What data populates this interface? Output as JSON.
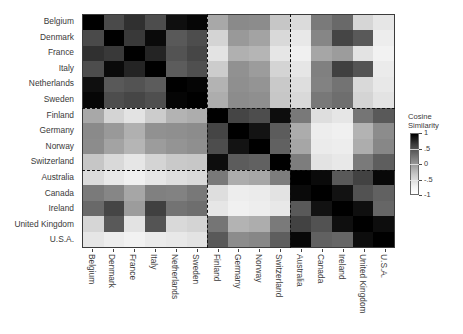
{
  "chart_data": {
    "type": "heatmap",
    "title": "",
    "xlabel": "",
    "ylabel": "",
    "grid": false,
    "legend_position": "right",
    "colormap": "grayscale-reversed",
    "colorbar": {
      "title_line1": "Cosine",
      "title_line2": "Similarity",
      "ticks": [
        "1",
        ".5",
        "0",
        "-.5",
        "-1"
      ],
      "vmin": -1,
      "vmax": 1,
      "dark_end_value": 1,
      "light_end_value": -1
    },
    "x_categories": [
      "Belgium",
      "Denmark",
      "France",
      "Italy",
      "Netherlands",
      "Sweden",
      "Finland",
      "Germany",
      "Norway",
      "Switzerland",
      "Australia",
      "Canada",
      "Ireland",
      "United Kingdom",
      "U.S.A."
    ],
    "y_categories": [
      "Belgium",
      "Denmark",
      "France",
      "Italy",
      "Netherlands",
      "Sweden",
      "Finland",
      "Germany",
      "Norway",
      "Switzerland",
      "Australia",
      "Canada",
      "Ireland",
      "United Kingdom",
      "U.S.A."
    ],
    "cluster_boundaries_after_index": [
      5,
      9
    ],
    "clusters": [
      {
        "name": "cluster-1",
        "members": [
          "Belgium",
          "Denmark",
          "France",
          "Italy",
          "Netherlands",
          "Sweden"
        ]
      },
      {
        "name": "cluster-2",
        "members": [
          "Finland",
          "Germany",
          "Norway",
          "Switzerland"
        ]
      },
      {
        "name": "cluster-3",
        "members": [
          "Australia",
          "Canada",
          "Ireland",
          "United Kingdom",
          "U.S.A."
        ]
      }
    ],
    "values": [
      [
        1.0,
        0.42,
        0.62,
        0.4,
        0.88,
        0.95,
        -0.32,
        -0.08,
        -0.1,
        -0.55,
        -0.72,
        0.04,
        0.18,
        -0.68,
        -0.8
      ],
      [
        0.42,
        1.0,
        0.55,
        0.92,
        0.3,
        0.4,
        -0.66,
        -0.2,
        -0.28,
        -0.7,
        -0.82,
        -0.05,
        0.46,
        0.3,
        -0.86
      ],
      [
        0.62,
        0.55,
        1.0,
        0.72,
        0.35,
        0.45,
        -0.78,
        -0.38,
        -0.42,
        -0.8,
        -0.88,
        -0.3,
        -0.22,
        -0.78,
        -0.9
      ],
      [
        0.4,
        0.92,
        0.72,
        1.0,
        0.28,
        0.38,
        -0.6,
        -0.14,
        -0.22,
        -0.66,
        -0.8,
        0.0,
        0.5,
        0.34,
        -0.84
      ],
      [
        0.88,
        0.3,
        0.35,
        0.28,
        1.0,
        0.96,
        -0.4,
        -0.12,
        -0.16,
        -0.58,
        -0.74,
        -0.02,
        0.1,
        -0.7,
        -0.82
      ],
      [
        0.95,
        0.4,
        0.45,
        0.38,
        0.96,
        1.0,
        -0.36,
        -0.1,
        -0.12,
        -0.56,
        -0.7,
        0.06,
        0.14,
        -0.66,
        -0.78
      ],
      [
        -0.32,
        -0.66,
        -0.78,
        -0.6,
        -0.4,
        -0.36,
        1.0,
        0.46,
        0.4,
        0.9,
        0.05,
        -0.74,
        -0.8,
        0.08,
        0.3
      ],
      [
        -0.08,
        -0.2,
        -0.38,
        -0.14,
        -0.12,
        -0.1,
        0.46,
        1.0,
        0.85,
        0.28,
        -0.35,
        -0.86,
        -0.88,
        -0.4,
        -0.1
      ],
      [
        -0.1,
        -0.28,
        -0.42,
        -0.22,
        -0.16,
        -0.12,
        0.4,
        0.85,
        1.0,
        0.24,
        -0.3,
        -0.84,
        -0.86,
        -0.36,
        -0.06
      ],
      [
        -0.55,
        -0.7,
        -0.8,
        -0.66,
        -0.58,
        -0.56,
        0.9,
        0.28,
        0.24,
        1.0,
        0.02,
        -0.78,
        -0.82,
        0.04,
        0.26
      ],
      [
        -0.72,
        -0.82,
        -0.88,
        -0.8,
        -0.74,
        -0.7,
        0.05,
        -0.35,
        -0.3,
        0.02,
        1.0,
        0.92,
        0.3,
        0.48,
        0.94
      ],
      [
        0.04,
        -0.05,
        -0.3,
        0.0,
        -0.02,
        0.06,
        -0.74,
        -0.86,
        -0.84,
        -0.78,
        0.92,
        1.0,
        0.86,
        0.36,
        0.24
      ],
      [
        0.18,
        0.46,
        -0.22,
        0.5,
        0.1,
        0.14,
        -0.8,
        -0.88,
        -0.86,
        -0.82,
        0.3,
        0.86,
        1.0,
        0.88,
        0.2
      ],
      [
        -0.68,
        0.3,
        -0.78,
        0.34,
        -0.7,
        -0.66,
        0.08,
        -0.4,
        -0.36,
        0.04,
        0.48,
        0.36,
        0.88,
        1.0,
        0.9
      ],
      [
        -0.8,
        -0.86,
        -0.9,
        -0.84,
        -0.82,
        -0.78,
        0.3,
        -0.1,
        -0.06,
        0.26,
        0.94,
        0.24,
        0.2,
        0.9,
        1.0
      ]
    ]
  }
}
